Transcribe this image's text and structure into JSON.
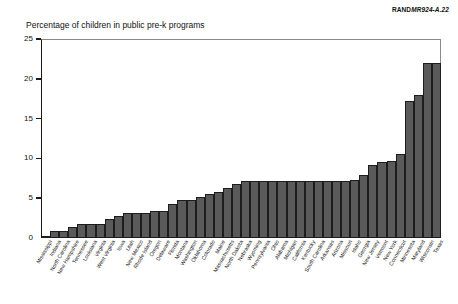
{
  "source_tag": {
    "prefix": "RAND",
    "code": "MR924-A.22"
  },
  "chart_data": {
    "type": "bar",
    "title": "Percentage of children in public pre-k programs",
    "xlabel": "",
    "ylabel": "",
    "ylim": [
      0,
      25
    ],
    "yticks": [
      0,
      5,
      10,
      15,
      20,
      25
    ],
    "grid": false,
    "legend": "none",
    "orientation": "vertical",
    "bar_color": "#5a5a5a",
    "categories": [
      "Mississippi",
      "Indiana",
      "North Carolina",
      "New Hampshire",
      "Tennessee",
      "Louisiana",
      "Virginia",
      "West Virginia",
      "Iowa",
      "Utah",
      "New Mexico",
      "Rhode Island",
      "Oregon",
      "Delaware",
      "Florida",
      "Montana",
      "Washington",
      "Oklahoma",
      "Colorado",
      "Maine",
      "Massachusetts",
      "North Dakota",
      "Nebraska",
      "Wyoming",
      "Pennsylvania",
      "Ohio",
      "Alabama",
      "Michigan",
      "California",
      "Kentucky",
      "South Carolina",
      "Arkansas",
      "Arizona",
      "Missouri",
      "Idaho",
      "Georgia",
      "New Jersey",
      "Vermont",
      "New York",
      "Connecticut",
      "Minnesota",
      "Maryland",
      "Wisconsin",
      "Texas"
    ],
    "values": [
      0.3,
      0.9,
      0.9,
      1.4,
      1.7,
      1.7,
      1.7,
      2.4,
      2.8,
      3.1,
      3.1,
      3.1,
      3.4,
      3.4,
      4.3,
      4.8,
      4.8,
      5.2,
      5.5,
      5.8,
      6.3,
      6.8,
      7.1,
      7.1,
      7.1,
      7.1,
      7.1,
      7.1,
      7.1,
      7.1,
      7.1,
      7.1,
      7.1,
      7.1,
      7.3,
      7.9,
      9.2,
      9.5,
      9.7,
      10.5,
      17.2,
      18.0,
      22.0,
      22.0
    ]
  }
}
